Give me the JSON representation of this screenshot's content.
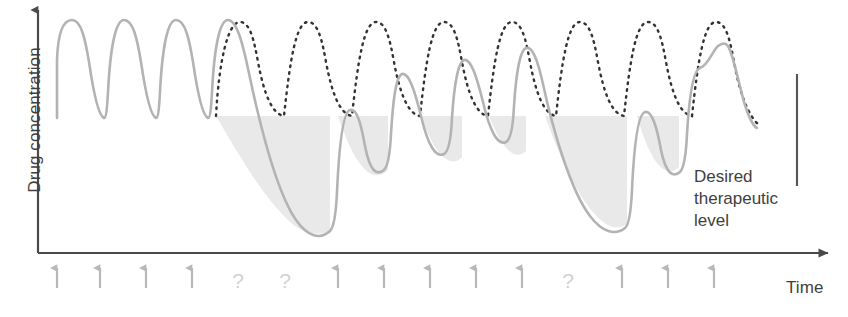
{
  "figure": {
    "axes": {
      "y_label": "Drug concentration",
      "x_label": "Time"
    },
    "annotation": {
      "line1": "Desired",
      "line2": "therapeutic",
      "line3": "level"
    },
    "colors": {
      "actual_curve": "#b3b3b3",
      "ideal_curve": "#333333",
      "shaded_band": "#e9e9e9",
      "axis": "#4a4a4a",
      "text": "#3f3f3f",
      "dose_arrow": "#b8b8b8",
      "missed_dose": "#d2d2d2",
      "marker_line": "#555555",
      "background": "#ffffff"
    }
  },
  "chart_data": {
    "type": "line",
    "xlabel": "Time",
    "ylabel": "Drug concentration",
    "grid": false,
    "legend": "none",
    "axis_ranges": {
      "x": [
        0,
        15
      ],
      "y": [
        0,
        1
      ]
    },
    "therapeutic_band": {
      "label": "Desired therapeutic level",
      "top_fraction": 1.0,
      "bottom_fraction": 0.0,
      "note": "Shaded region marks concentration deficit below the desired trough level"
    },
    "dose_events": [
      {
        "index": 1,
        "x_px": 57,
        "type": "dose",
        "symbol": "arrow-up"
      },
      {
        "index": 2,
        "x_px": 100,
        "type": "dose",
        "symbol": "arrow-up"
      },
      {
        "index": 3,
        "x_px": 146,
        "type": "dose",
        "symbol": "arrow-up"
      },
      {
        "index": 4,
        "x_px": 192,
        "type": "dose",
        "symbol": "arrow-up"
      },
      {
        "index": 5,
        "x_px": 238,
        "type": "missed",
        "symbol": "?"
      },
      {
        "index": 6,
        "x_px": 285,
        "type": "missed",
        "symbol": "?"
      },
      {
        "index": 7,
        "x_px": 338,
        "type": "dose",
        "symbol": "arrow-up"
      },
      {
        "index": 8,
        "x_px": 384,
        "type": "dose",
        "symbol": "arrow-up"
      },
      {
        "index": 9,
        "x_px": 430,
        "type": "dose",
        "symbol": "arrow-up"
      },
      {
        "index": 10,
        "x_px": 476,
        "type": "dose",
        "symbol": "arrow-up"
      },
      {
        "index": 11,
        "x_px": 522,
        "type": "dose",
        "symbol": "arrow-up"
      },
      {
        "index": 12,
        "x_px": 568,
        "type": "missed",
        "symbol": "?"
      },
      {
        "index": 13,
        "x_px": 622,
        "type": "dose",
        "symbol": "arrow-up"
      },
      {
        "index": 14,
        "x_px": 668,
        "type": "dose",
        "symbol": "arrow-up"
      },
      {
        "index": 15,
        "x_px": 714,
        "type": "dose",
        "symbol": "arrow-up"
      }
    ],
    "series": [
      {
        "name": "Actual drug concentration",
        "style": "solid",
        "color": "#b3b3b3",
        "description": "Rises to peak after each taken dose; decays continuously through missed doses"
      },
      {
        "name": "Ideal drug concentration (all doses taken)",
        "style": "dotted",
        "color": "#333333",
        "description": "Regular saw-tooth peaks and troughs within the therapeutic range"
      }
    ],
    "peak_value_fraction": 0.92,
    "trough_value_fraction": 0.5,
    "cycle_count_ideal": 15,
    "missed_dose_count": 3,
    "taken_dose_count": 12
  }
}
